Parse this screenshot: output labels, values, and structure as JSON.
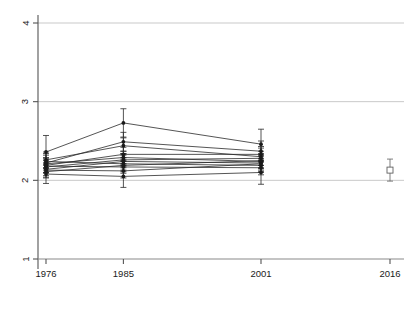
{
  "chart_data": {
    "type": "line",
    "title": "",
    "subtitle": "",
    "xlabel": "",
    "ylabel": "",
    "xlim": [
      1972,
      2020
    ],
    "ylim": [
      1,
      4
    ],
    "grid": true,
    "grid_axis": "y",
    "legend": "none",
    "x_ticks": [
      1976,
      1985,
      2001,
      2016
    ],
    "x_tick_labels": [
      "1976",
      "1985",
      "2001",
      "2016"
    ],
    "y_ticks": [
      1,
      2,
      3,
      4
    ],
    "y_tick_labels": [
      "1",
      "2",
      "3",
      "4"
    ],
    "x": [
      1976,
      1985,
      2001
    ],
    "marker": "filled-circle",
    "errorbar": "vertical-capped",
    "series": [
      {
        "name": "S1",
        "values": [
          2.36,
          2.73,
          2.46
        ],
        "err": [
          0.21,
          0.18,
          0.19
        ]
      },
      {
        "name": "S2",
        "values": [
          2.22,
          2.49,
          2.37
        ],
        "err": [
          0.12,
          0.12,
          0.13
        ]
      },
      {
        "name": "S3",
        "values": [
          2.26,
          2.44,
          2.3
        ],
        "err": [
          0.1,
          0.1,
          0.11
        ]
      },
      {
        "name": "S4",
        "values": [
          2.19,
          2.33,
          2.33
        ],
        "err": [
          0.09,
          0.09,
          0.1
        ]
      },
      {
        "name": "S5",
        "values": [
          2.21,
          2.29,
          2.24
        ],
        "err": [
          0.08,
          0.08,
          0.09
        ]
      },
      {
        "name": "S6",
        "values": [
          2.17,
          2.26,
          2.28
        ],
        "err": [
          0.08,
          0.08,
          0.09
        ]
      },
      {
        "name": "S7",
        "values": [
          2.14,
          2.24,
          2.22
        ],
        "err": [
          0.08,
          0.08,
          0.09
        ]
      },
      {
        "name": "S8",
        "values": [
          2.24,
          2.21,
          2.19
        ],
        "err": [
          0.08,
          0.08,
          0.09
        ]
      },
      {
        "name": "S9",
        "values": [
          2.11,
          2.19,
          2.25
        ],
        "err": [
          0.08,
          0.08,
          0.09
        ]
      },
      {
        "name": "S10",
        "values": [
          2.18,
          2.17,
          2.16
        ],
        "err": [
          0.08,
          0.08,
          0.09
        ]
      },
      {
        "name": "S11",
        "values": [
          2.13,
          2.12,
          2.21
        ],
        "err": [
          0.09,
          0.09,
          0.1
        ]
      },
      {
        "name": "S12",
        "values": [
          2.08,
          2.05,
          2.1
        ],
        "err": [
          0.12,
          0.14,
          0.15
        ]
      }
    ],
    "standalone_points": [
      {
        "name": "2016-estimate",
        "x": 2016,
        "y": 2.13,
        "err": 0.14,
        "marker": "open-square"
      }
    ],
    "colors": {
      "line": "#2a2a2a",
      "marker": "#1a1a1a",
      "gridline": "#c9c9c9",
      "axis": "#555555",
      "background": "#ffffff"
    }
  }
}
